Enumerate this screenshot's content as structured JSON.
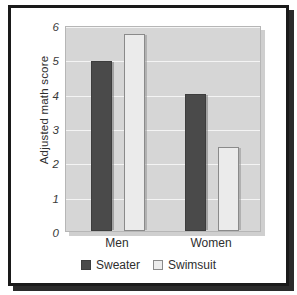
{
  "chart_data": {
    "type": "bar",
    "title": "",
    "subtitle": "",
    "xlabel": "",
    "ylabel": "Adjusted math score",
    "categories": [
      "Men",
      "Women"
    ],
    "series": [
      {
        "name": "Sweater",
        "values": [
          4.95,
          4.0
        ],
        "color": "#4a4a4a"
      },
      {
        "name": "Swimsuit",
        "values": [
          5.75,
          2.45
        ],
        "color": "#ebebeb"
      }
    ],
    "ylim": [
      0,
      6
    ],
    "ytick_labels": [
      "0",
      "1",
      "2",
      "3",
      "4",
      "5",
      "6"
    ],
    "ytick_values": [
      0,
      1,
      2,
      3,
      4,
      5,
      6
    ],
    "grid": true,
    "grid_axis": "y",
    "grid_color": "#f4f4f4",
    "legend_position": "bottom-center",
    "plot_background": "#d6d6d6",
    "figure_background": "#ffffff",
    "frame_color": "#1a1a1a"
  },
  "legend": {
    "entries": [
      {
        "label": "Sweater",
        "swatch": "filled-dark-square"
      },
      {
        "label": "Swimsuit",
        "swatch": "outlined-light-square"
      }
    ]
  }
}
